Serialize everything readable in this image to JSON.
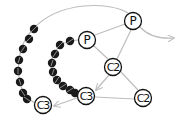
{
  "diagram": {
    "colors": {
      "edge": "#bdbdbd",
      "node_stroke": "#111111",
      "node_fill": "#ffffff",
      "bead": "#1a1a1a",
      "bead_stroke": "#9a9a9a"
    },
    "nodes": [
      {
        "id": "p_left",
        "label": "P",
        "x": 87,
        "y": 40
      },
      {
        "id": "p_right",
        "label": "P",
        "x": 133,
        "y": 21
      },
      {
        "id": "c2_mid",
        "label": "C2",
        "x": 113,
        "y": 67
      },
      {
        "id": "c3_mid",
        "label": "C3",
        "x": 86,
        "y": 96
      },
      {
        "id": "c2_right",
        "label": "C2",
        "x": 143,
        "y": 98
      },
      {
        "id": "c3_left",
        "label": "C3",
        "x": 43,
        "y": 105
      }
    ],
    "edges": [
      {
        "from": "p_left",
        "to": "p_right"
      },
      {
        "from": "p_left",
        "to": "c2_mid"
      },
      {
        "from": "p_right",
        "to": "c2_mid"
      },
      {
        "from": "c2_mid",
        "to": "c3_mid",
        "arrow": true
      },
      {
        "from": "c2_mid",
        "to": "c2_right"
      },
      {
        "from": "c2_right",
        "to": "c3_mid"
      },
      {
        "from": "c3_mid",
        "to": "c3_left",
        "arrow": true
      },
      {
        "from": "p_right",
        "to": "offscreen_right",
        "arrow": true
      }
    ],
    "bead_chains": [
      {
        "name": "outer-chain",
        "count": 8
      },
      {
        "name": "inner-chain",
        "count": 9
      }
    ]
  }
}
